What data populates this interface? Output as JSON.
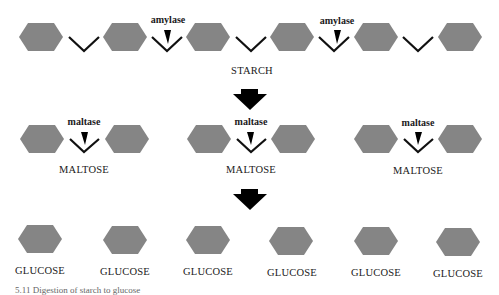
{
  "diagram": {
    "title": "Digestion of starch to glucose",
    "colors": {
      "sugar_unit": "#858585",
      "bond": "#111111",
      "arrow": "#000000",
      "text": "#1a1a1a"
    },
    "stages": [
      {
        "name": "starch",
        "label": "STARCH",
        "units": 6,
        "enzyme": "amylase",
        "enzyme_sites": 2
      },
      {
        "name": "maltose",
        "label": "MALTOSE",
        "count": 3,
        "units_each": 2,
        "enzyme": "maltase"
      },
      {
        "name": "glucose",
        "label": "GLUCOSE",
        "count": 6,
        "units_each": 1
      }
    ],
    "labels": {
      "starch": "STARCH",
      "amylase_1": "amylase",
      "amylase_2": "amylase",
      "maltase_1": "maltase",
      "maltase_2": "maltase",
      "maltase_3": "maltase",
      "maltose_1": "MALTOSE",
      "maltose_2": "MALTOSE",
      "maltose_3": "MALTOSE",
      "glucose_1": "GLUCOSE",
      "glucose_2": "GLUCOSE",
      "glucose_3": "GLUCOSE",
      "glucose_4": "GLUCOSE",
      "glucose_5": "GLUCOSE",
      "glucose_6": "GLUCOSE"
    },
    "caption": "5.11 Digestion of starch to glucose"
  }
}
